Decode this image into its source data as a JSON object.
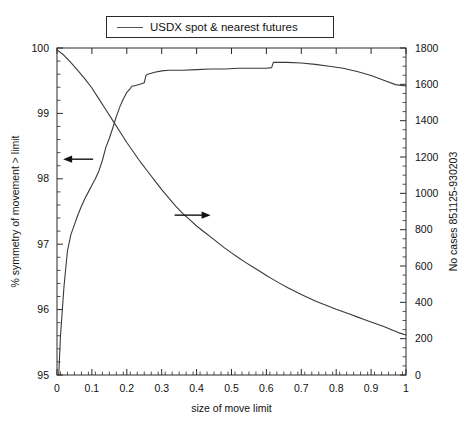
{
  "legend": {
    "label": "USDX spot & nearest futures",
    "swatch_name": "line-swatch"
  },
  "axes": {
    "x_label": "size of move limit",
    "y_left_label": "% symmetry of movement > limit",
    "y_right_label": "No cases 851125-930203",
    "x_ticks": [
      "0",
      "0.1",
      "0.2",
      "0.3",
      "0.4",
      "0.5",
      "0.6",
      "0.7",
      "0.8",
      "0.9",
      "1"
    ],
    "y_left_ticks": [
      "95",
      "96",
      "97",
      "98",
      "99",
      "100"
    ],
    "y_right_ticks": [
      "0",
      "200",
      "400",
      "600",
      "800",
      "1000",
      "1200",
      "1400",
      "1600",
      "1800"
    ]
  },
  "annotations": [
    {
      "name": "left-arrow-annotation",
      "glyph": "←",
      "x": 0.155,
      "y_left": 98.3
    },
    {
      "name": "right-arrow-annotation",
      "glyph": "→",
      "x": 0.4,
      "y_right": 880
    }
  ],
  "colors": {
    "line": "#3a3a3a",
    "axis": "#2a2a2a",
    "text": "#111111",
    "background": "#ffffff"
  },
  "chart_data": {
    "type": "line",
    "title": "",
    "xlabel": "size of move limit",
    "ylabel": "% symmetry of movement > limit",
    "ylabel_right": "No cases 851125-930203",
    "xlim": [
      0,
      1
    ],
    "ylim_left": [
      95,
      100
    ],
    "ylim_right": [
      0,
      1800
    ],
    "grid": false,
    "legend": "USDX spot & nearest futures",
    "legend_position": "top-center",
    "series": [
      {
        "name": "% symmetry of movement > limit",
        "axis": "left",
        "x": [
          0.005,
          0.01,
          0.02,
          0.03,
          0.04,
          0.05,
          0.06,
          0.07,
          0.08,
          0.09,
          0.1,
          0.11,
          0.12,
          0.13,
          0.14,
          0.15,
          0.16,
          0.17,
          0.18,
          0.19,
          0.2,
          0.21,
          0.215,
          0.22,
          0.24,
          0.25,
          0.255,
          0.26,
          0.28,
          0.3,
          0.32,
          0.34,
          0.36,
          0.4,
          0.44,
          0.48,
          0.52,
          0.56,
          0.6,
          0.615,
          0.62,
          0.66,
          0.7,
          0.74,
          0.78,
          0.82,
          0.86,
          0.9,
          0.94,
          0.97,
          1.0
        ],
        "y": [
          95.0,
          95.6,
          96.35,
          96.9,
          97.15,
          97.3,
          97.45,
          97.58,
          97.7,
          97.8,
          97.9,
          98.0,
          98.12,
          98.28,
          98.48,
          98.62,
          98.78,
          98.95,
          99.1,
          99.22,
          99.32,
          99.38,
          99.42,
          99.42,
          99.45,
          99.47,
          99.58,
          99.6,
          99.63,
          99.65,
          99.66,
          99.66,
          99.66,
          99.67,
          99.68,
          99.68,
          99.69,
          99.69,
          99.69,
          99.7,
          99.78,
          99.78,
          99.77,
          99.75,
          99.72,
          99.69,
          99.64,
          99.58,
          99.5,
          99.44,
          99.42
        ]
      },
      {
        "name": "No cases 851125-930203",
        "axis": "right",
        "x": [
          0.0,
          0.02,
          0.04,
          0.06,
          0.08,
          0.1,
          0.12,
          0.14,
          0.16,
          0.18,
          0.2,
          0.22,
          0.24,
          0.26,
          0.28,
          0.3,
          0.32,
          0.34,
          0.36,
          0.38,
          0.4,
          0.42,
          0.44,
          0.46,
          0.48,
          0.5,
          0.52,
          0.54,
          0.56,
          0.58,
          0.6,
          0.62,
          0.64,
          0.66,
          0.68,
          0.7,
          0.72,
          0.74,
          0.76,
          0.78,
          0.8,
          0.82,
          0.84,
          0.86,
          0.88,
          0.9,
          0.92,
          0.94,
          0.96,
          0.98,
          1.0
        ],
        "y": [
          1790,
          1760,
          1720,
          1675,
          1630,
          1580,
          1520,
          1460,
          1400,
          1340,
          1280,
          1225,
          1170,
          1120,
          1070,
          1020,
          975,
          930,
          890,
          855,
          820,
          790,
          760,
          730,
          700,
          672,
          645,
          620,
          596,
          572,
          548,
          525,
          503,
          482,
          462,
          443,
          425,
          408,
          392,
          377,
          362,
          348,
          334,
          320,
          306,
          292,
          278,
          264,
          248,
          232,
          220
        ]
      }
    ]
  }
}
